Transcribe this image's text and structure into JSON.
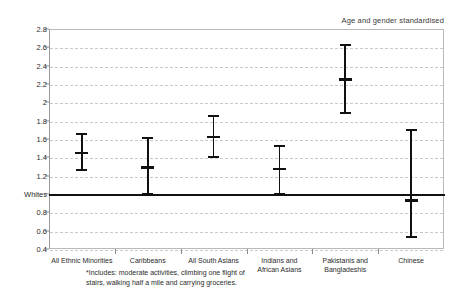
{
  "chart_data": {
    "type": "scatter",
    "title": "Age and gender standardised",
    "xlabel": "",
    "ylabel": "",
    "ylim": [
      0.4,
      2.8
    ],
    "y_ticks": [
      "0.4",
      "0.6",
      "0.8",
      "Whites",
      "1.2",
      "1.4",
      "1.6",
      "1.8",
      "2",
      "2.2",
      "2.4",
      "2.6",
      "2.8"
    ],
    "y_tick_values": [
      0.4,
      0.6,
      0.8,
      1.0,
      1.2,
      1.4,
      1.6,
      1.8,
      2.0,
      2.2,
      2.4,
      2.6,
      2.8
    ],
    "reference_line": {
      "label": "Whites",
      "value": 1.0
    },
    "grid": "horizontal-dashed",
    "legend": "none",
    "categories": [
      "All Ethnic Minorities",
      "Caribbeans",
      "All South Asians",
      "Indians and\nAfrican Asians",
      "Pakistanis and\nBangladeshis",
      "Chinese"
    ],
    "series": [
      {
        "name": "Odds ratio (with 95% confidence interval)",
        "points": [
          {
            "category": "All Ethnic Minorities",
            "value": 1.45,
            "low": 1.26,
            "high": 1.65
          },
          {
            "category": "Caribbeans",
            "value": 1.29,
            "low": 1.0,
            "high": 1.61
          },
          {
            "category": "All South Asians",
            "value": 1.62,
            "low": 1.4,
            "high": 1.85
          },
          {
            "category": "Indians and African Asians",
            "value": 1.27,
            "low": 1.0,
            "high": 1.52
          },
          {
            "category": "Pakistanis and Bangladeshis",
            "value": 2.25,
            "low": 1.88,
            "high": 2.63
          },
          {
            "category": "Chinese",
            "value": 0.93,
            "low": 0.53,
            "high": 1.7
          }
        ]
      }
    ],
    "footnote": "*Includes: moderate activities, climbing one flight of\nstairs, walking half a mile and carrying groceries."
  },
  "colors": {
    "marker": "#111111",
    "reference_line": "#111111",
    "grid": "#c9c9c9",
    "frame": "#b9b9b9",
    "text": "#2b2b2b"
  }
}
